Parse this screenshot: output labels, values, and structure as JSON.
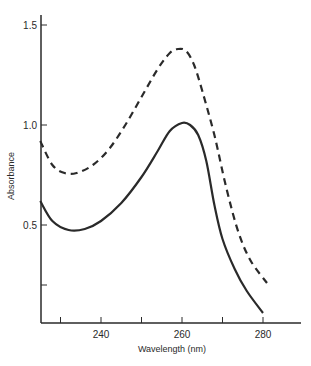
{
  "chart_data": {
    "type": "line",
    "title": "",
    "xlabel": "Wavelength (nm)",
    "ylabel": "Absorbance",
    "xlim": [
      225,
      290
    ],
    "ylim": [
      0,
      1.6
    ],
    "grid": false,
    "legend": null,
    "x_ticks": [
      {
        "value": 230,
        "label": ""
      },
      {
        "value": 240,
        "label": "240"
      },
      {
        "value": 250,
        "label": ""
      },
      {
        "value": 260,
        "label": "260"
      },
      {
        "value": 270,
        "label": ""
      },
      {
        "value": 280,
        "label": "280"
      }
    ],
    "y_ticks": [
      {
        "value": 0.2,
        "label": ""
      },
      {
        "value": 0.5,
        "label": "0.5"
      },
      {
        "value": 1.0,
        "label": "1.0"
      },
      {
        "value": 1.5,
        "label": "1.5"
      }
    ],
    "series": [
      {
        "name": "dashed curve",
        "style": "dashed",
        "color": "#2a2a2a",
        "x": [
          225,
          228,
          231,
          234,
          238,
          242,
          246,
          250,
          254,
          257,
          259,
          261,
          263,
          265,
          268,
          271,
          274,
          277,
          281
        ],
        "y": [
          0.92,
          0.8,
          0.76,
          0.76,
          0.8,
          0.88,
          1.0,
          1.14,
          1.28,
          1.36,
          1.38,
          1.37,
          1.3,
          1.17,
          0.95,
          0.68,
          0.46,
          0.32,
          0.21
        ]
      },
      {
        "name": "solid curve",
        "style": "solid",
        "color": "#2a2a2a",
        "x": [
          225,
          228,
          232,
          236,
          240,
          245,
          250,
          254,
          257,
          260,
          262,
          264,
          266,
          268,
          270,
          273,
          276,
          280
        ],
        "y": [
          0.62,
          0.52,
          0.475,
          0.48,
          0.52,
          0.61,
          0.74,
          0.87,
          0.97,
          1.01,
          1.0,
          0.95,
          0.82,
          0.6,
          0.43,
          0.28,
          0.17,
          0.06
        ]
      }
    ]
  },
  "layout": {
    "x_px": {
      "ref_value": 240,
      "ref_px": 101,
      "px_per_unit": 4.05
    },
    "y_px": {
      "ref_value": 0,
      "ref_px": 325,
      "px_per_unit": 200
    },
    "plot_left": 41,
    "plot_bottom": 323,
    "plot_right": 301,
    "plot_top": 15
  }
}
